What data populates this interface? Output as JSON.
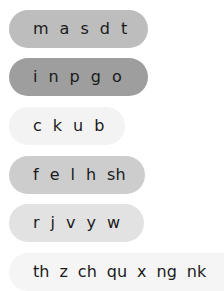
{
  "sets": [
    {
      "color": "#bdbdbd",
      "sounds": [
        "m",
        "a",
        "s",
        "d",
        "t"
      ]
    },
    {
      "color": "#9e9e9e",
      "sounds": [
        "i",
        "n",
        "p",
        "g",
        "o"
      ]
    },
    {
      "color": "#f3f3f3",
      "sounds": [
        "c",
        "k",
        "u",
        "b"
      ]
    },
    {
      "color": "#cdcdcd",
      "sounds": [
        "f",
        "e",
        "l",
        "h",
        "sh"
      ]
    },
    {
      "color": "#e2e2e2",
      "sounds": [
        "r",
        "j",
        "v",
        "y",
        "w"
      ]
    },
    {
      "color": "#f5f5f5",
      "sounds": [
        "th",
        "z",
        "ch",
        "qu",
        "x",
        "ng",
        "nk"
      ]
    }
  ]
}
